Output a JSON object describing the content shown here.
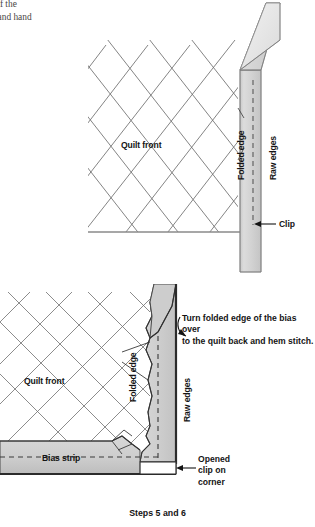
{
  "page": {
    "background_color": "#ffffff",
    "body_text": "ge of the\nck, and hand\nce."
  },
  "palette": {
    "ink": "#141414",
    "body_text_color": "#4a4846",
    "quilt_line": "#6b6b6b",
    "strip_fill": "#d2d2d2",
    "strip_fill_light": "#e6e6e6",
    "strip_fill_dark": "#b9b9b9",
    "outline": "#3a3a3a",
    "dashed_line": "#4a4a4a"
  },
  "figure_one": {
    "name": "binding-strip-pinned-to-quilt-edge",
    "labels": {
      "quilt_front": "Quilt front",
      "folded_edge": "Folded edge",
      "raw_edges": "Raw edges",
      "clip": "Clip"
    }
  },
  "figure_two": {
    "name": "binding-turned-to-quilt-back-corner",
    "labels": {
      "quilt_front": "Quilt front",
      "folded_edge": "Folded edge",
      "raw_edges": "Raw edges",
      "bias_strip": "Bias strip",
      "opened_clip": "Opened\nclip on\ncorner",
      "instruction": "Turn folded edge of the bias over\nto the quilt back and hem stitch."
    }
  },
  "caption": "Steps 5 and 6"
}
